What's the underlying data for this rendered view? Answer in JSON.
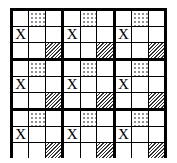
{
  "diagram": {
    "rows": 3,
    "cols": 3,
    "block_pattern": [
      "blank",
      "dots",
      "blank",
      "X",
      "blank",
      "blank",
      "blank",
      "blank",
      "hatch"
    ],
    "mark": "X",
    "colors": {
      "border": "#000000",
      "background": "#ffffff"
    }
  }
}
